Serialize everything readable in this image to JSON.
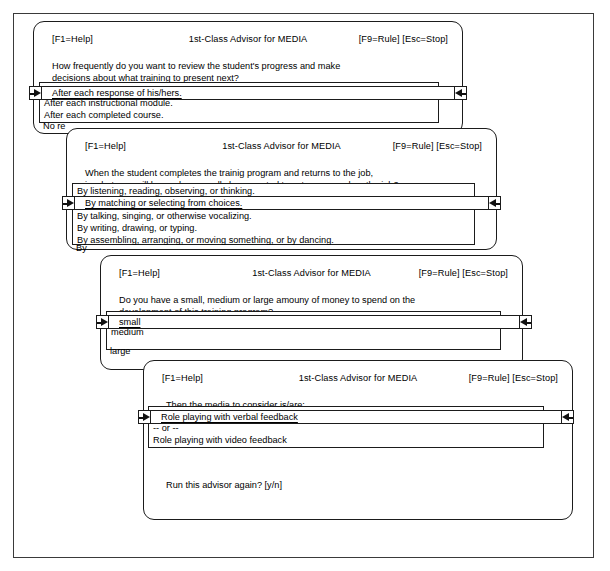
{
  "app": {
    "header_left": "[F1=Help]",
    "header_center": "1st-Class Advisor for MEDIA",
    "header_right": "[F9=Rule] [Esc=Stop]"
  },
  "windows": [
    {
      "id": "window-1",
      "prompt_line1": "How frequently do you want to review the student's progress and make",
      "prompt_line2": "decisions about what training to present next?",
      "options": [
        "After each response of his/hers.",
        "After each instructional module.",
        "After each completed course.",
        "No re"
      ],
      "selected_index": 0,
      "selected_text": "After each response of his/hers."
    },
    {
      "id": "window-2",
      "prompt_line1": "When the student completes the trainig program and returns to the job,",
      "prompt_line2": "in what way will he or she normally be expected to act or respond on the job?",
      "options": [
        "By listening, reading, observing, or thinking.",
        "By matching or selecting from choices.",
        "By talking, singing, or otherwise vocalizing.",
        "By writing, drawing, or typing.",
        "By assembling, arranging, or moving something, or by dancing.",
        "By"
      ],
      "selected_index": 1,
      "selected_text": "By matching or selecting from choices."
    },
    {
      "id": "window-3",
      "prompt_line1": "Do you have a small, medium or large amouny of money to spend on the",
      "prompt_line2": "development of this training program?",
      "options": [
        "small",
        "medium",
        "large"
      ],
      "selected_index": 0,
      "selected_text": "small"
    },
    {
      "id": "window-4",
      "prompt_line1": "Then the media to consider is/are:",
      "prompt_line2": "",
      "options": [
        "Role playing with verbal feedback",
        " -- or --",
        "Role playing with video feedback"
      ],
      "selected_index": 0,
      "selected_text": "Role playing with verbal feedback",
      "footer": "Run this advisor again? [y/n]"
    }
  ],
  "icons": {
    "cursor_right": "arrow-right-icon",
    "cursor_left": "arrow-left-icon"
  },
  "colors": {
    "ink": "#1b1b1b",
    "frame": "#3a3a3a",
    "paper": "#ffffff"
  }
}
